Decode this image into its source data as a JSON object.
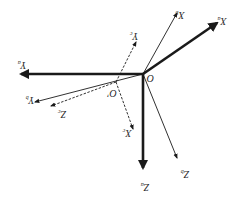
{
  "diagram": {
    "rotated_180": true,
    "colors": {
      "stroke": "#1a1a1a",
      "background": "#ffffff"
    },
    "origins": [
      {
        "id": "O",
        "label": "O",
        "x": 143,
        "y": 74
      },
      {
        "id": "O_prime",
        "label": "O′",
        "x": 116,
        "y": 82
      }
    ],
    "frames": [
      {
        "id": "a",
        "style": "thick",
        "origin": "O",
        "axes": [
          {
            "name": "X",
            "sub": "a",
            "to": [
              217,
              23
            ],
            "label_pos": [
              222,
              20
            ]
          },
          {
            "name": "Y",
            "sub": "a",
            "to": [
              21,
              74
            ],
            "label_pos": [
              22,
              64
            ]
          },
          {
            "name": "Z",
            "sub": "a",
            "to": [
              143,
              168
            ],
            "label_pos": [
              145,
              186
            ]
          }
        ]
      },
      {
        "id": "b",
        "style": "thin",
        "origin": "O",
        "axes": [
          {
            "name": "X",
            "sub": "b",
            "to": [
              177,
              13
            ],
            "label_pos": [
              180,
              14
            ]
          },
          {
            "name": "Y",
            "sub": "b",
            "to": [
              35,
              102
            ],
            "label_pos": [
              30,
              99
            ]
          },
          {
            "name": "Z",
            "sub": "b",
            "to": [
              177,
              158
            ],
            "label_pos": [
              185,
              173
            ]
          }
        ]
      },
      {
        "id": "c",
        "style": "dashed",
        "origin": "O_prime",
        "axes": [
          {
            "name": "X",
            "sub": "c",
            "to": [
              133,
              129
            ],
            "label_pos": [
              127,
              132
            ]
          },
          {
            "name": "Y",
            "sub": "c",
            "to": [
              136,
              42
            ],
            "label_pos": [
              134,
              35
            ]
          },
          {
            "name": "Z",
            "sub": "c",
            "to": [
              51,
              106
            ],
            "label_pos": [
              62,
              113
            ]
          }
        ]
      }
    ]
  }
}
